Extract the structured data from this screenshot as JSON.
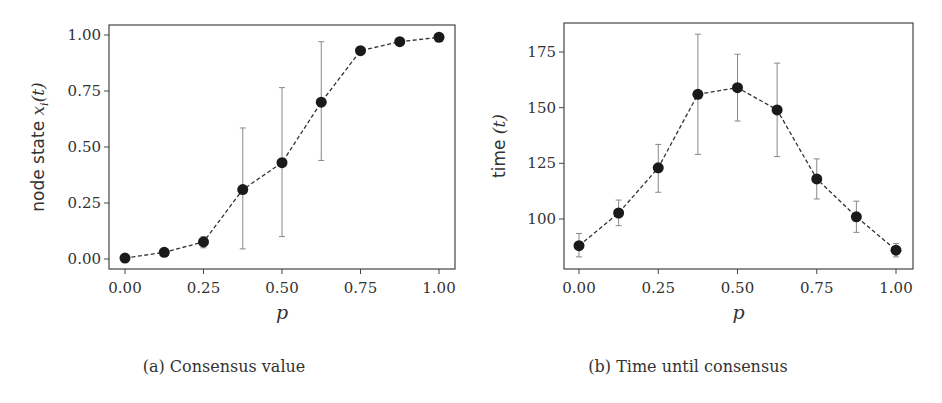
{
  "chart_data": [
    {
      "type": "line",
      "panel": "a",
      "caption": "(a) Consensus value",
      "xlabel": "p",
      "ylabel": "node state x_i(t)",
      "ylabel_text": "node state ",
      "ylabel_math": "x",
      "ylabel_sub": "i",
      "ylabel_tail": "(t)",
      "xlim": [
        -0.05,
        1.05
      ],
      "ylim": [
        -0.045,
        1.045
      ],
      "xticks": [
        0.0,
        0.25,
        0.5,
        0.75,
        1.0
      ],
      "xtick_labels": [
        "0.00",
        "0.25",
        "0.50",
        "0.75",
        "1.00"
      ],
      "yticks": [
        0.0,
        0.25,
        0.5,
        0.75,
        1.0
      ],
      "ytick_labels": [
        "0.00",
        "0.25",
        "0.50",
        "0.75",
        "1.00"
      ],
      "grid": false,
      "line_style": "dashed",
      "marker": "circle",
      "color": "#1a1a1a",
      "x": [
        0.0,
        0.125,
        0.25,
        0.375,
        0.5,
        0.625,
        0.75,
        0.875,
        1.0
      ],
      "values": [
        0.004,
        0.03,
        0.076,
        0.31,
        0.43,
        0.7,
        0.93,
        0.97,
        0.99
      ],
      "err_low": [
        0.004,
        0.03,
        0.05,
        0.045,
        0.1,
        0.44,
        0.93,
        0.97,
        0.99
      ],
      "err_high": [
        0.004,
        0.03,
        0.1,
        0.585,
        0.765,
        0.97,
        0.93,
        0.97,
        0.99
      ]
    },
    {
      "type": "line",
      "panel": "b",
      "caption": "(b) Time until consensus",
      "xlabel": "p",
      "ylabel": "time (t)",
      "ylabel_text": "time ",
      "ylabel_tail": "(t)",
      "xlim": [
        -0.05,
        1.05
      ],
      "ylim": [
        80,
        188
      ],
      "xticks": [
        0.0,
        0.25,
        0.5,
        0.75,
        1.0
      ],
      "xtick_labels": [
        "0.00",
        "0.25",
        "0.50",
        "0.75",
        "1.00"
      ],
      "yticks": [
        100,
        125,
        150,
        175
      ],
      "ytick_labels": [
        "100",
        "125",
        "150",
        "175"
      ],
      "grid": false,
      "line_style": "dashed",
      "marker": "circle",
      "color": "#1a1a1a",
      "x": [
        0.0,
        0.125,
        0.25,
        0.375,
        0.5,
        0.625,
        0.75,
        0.875,
        1.0
      ],
      "values": [
        88,
        102.7,
        123,
        156,
        159,
        149,
        118,
        101,
        86
      ],
      "err_low": [
        83,
        97,
        112,
        129,
        144,
        128,
        109,
        94,
        83
      ],
      "err_high": [
        93.5,
        108.5,
        133.5,
        183,
        174,
        170,
        127,
        108,
        89
      ]
    }
  ],
  "layout": {
    "panels": [
      {
        "frame": [
          109,
          25,
          455,
          269
        ],
        "x0px": 125,
        "x1px": 439,
        "y_ref": [
          0.0,
          259,
          1.0,
          35
        ]
      },
      {
        "frame": [
          564,
          23,
          913,
          269
        ],
        "x0px": 579,
        "x1px": 896,
        "y_ref": [
          100,
          219,
          175,
          52
        ]
      }
    ],
    "colors": {
      "axis": "#444444",
      "line": "#333333",
      "marker": "#1a1a1a",
      "errorbar": "#888888"
    }
  }
}
